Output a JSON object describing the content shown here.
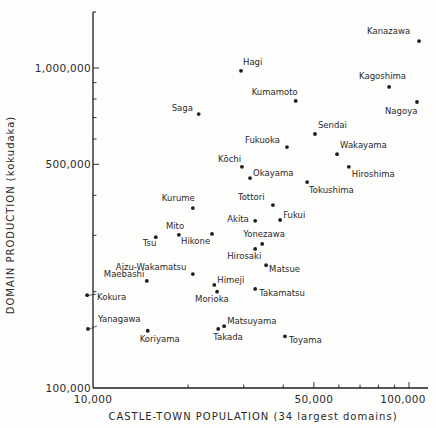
{
  "chart_data": {
    "type": "scatter",
    "title": "",
    "xlabel": "CASTLE-TOWN POPULATION (34 largest domains)",
    "ylabel": "DOMAIN PRODUCTION (kokudaka)",
    "xscale": "log",
    "yscale": "log",
    "xlim": [
      10000,
      110000
    ],
    "ylim": [
      100000,
      1300000
    ],
    "x_tick_labels": [
      "10,000",
      "50,000",
      "100,000"
    ],
    "y_tick_labels": [
      "100,000",
      "500,000",
      "1,000,000"
    ],
    "grid": false,
    "legend": null,
    "points": [
      {
        "name": "Kanazawa",
        "x": 107600,
        "y": 1214000
      },
      {
        "name": "Hagi",
        "x": 29400,
        "y": 980000
      },
      {
        "name": "Kagoshima",
        "x": 86500,
        "y": 873000
      },
      {
        "name": "Kumamoto",
        "x": 43800,
        "y": 789000
      },
      {
        "name": "Nagoya",
        "x": 106000,
        "y": 783000
      },
      {
        "name": "Saga",
        "x": 21600,
        "y": 718000
      },
      {
        "name": "Sendai",
        "x": 50400,
        "y": 622000
      },
      {
        "name": "Fukuoka",
        "x": 41100,
        "y": 566000
      },
      {
        "name": "Wakayama",
        "x": 59200,
        "y": 538000
      },
      {
        "name": "Kōchi",
        "x": 29600,
        "y": 491000
      },
      {
        "name": "Hiroshima",
        "x": 64500,
        "y": 491000
      },
      {
        "name": "Okayama",
        "x": 31400,
        "y": 453000
      },
      {
        "name": "Tokushima",
        "x": 47600,
        "y": 440000
      },
      {
        "name": "Tottori",
        "x": 37100,
        "y": 373000
      },
      {
        "name": "Kurume",
        "x": 20700,
        "y": 365000
      },
      {
        "name": "Fukui",
        "x": 39100,
        "y": 335000
      },
      {
        "name": "Akita",
        "x": 32600,
        "y": 333000
      },
      {
        "name": "Hikone",
        "x": 23800,
        "y": 303000
      },
      {
        "name": "Mito",
        "x": 18700,
        "y": 301000
      },
      {
        "name": "Tsu",
        "x": 15800,
        "y": 296000
      },
      {
        "name": "Yonezawa",
        "x": 34300,
        "y": 282000
      },
      {
        "name": "Hirosaki",
        "x": 32600,
        "y": 272000
      },
      {
        "name": "Matsue",
        "x": 35300,
        "y": 242000
      },
      {
        "name": "Aizu-Wakamatsu",
        "x": 20700,
        "y": 227000
      },
      {
        "name": "Maebashi",
        "x": 14800,
        "y": 216000
      },
      {
        "name": "Himeji",
        "x": 24200,
        "y": 210000
      },
      {
        "name": "Takamatsu",
        "x": 32600,
        "y": 204000
      },
      {
        "name": "Morioka",
        "x": 24700,
        "y": 200000
      },
      {
        "name": "Kokura",
        "x": 9580,
        "y": 195000
      },
      {
        "name": "Matsuyama",
        "x": 26000,
        "y": 156000
      },
      {
        "name": "Yanagawa",
        "x": 9640,
        "y": 153000
      },
      {
        "name": "Takada",
        "x": 24900,
        "y": 153000
      },
      {
        "name": "Koriyama",
        "x": 14900,
        "y": 151000
      },
      {
        "name": "Toyama",
        "x": 40500,
        "y": 145000
      }
    ]
  },
  "layout": {
    "plot": {
      "x0": 93,
      "x_decade_px": 316,
      "y0": 388,
      "y_decade_px": 320,
      "top": 12,
      "right": 428
    },
    "label_offsets": {
      "Kanazawa": [
        -52,
        -7,
        "start"
      ],
      "Hagi": [
        2,
        -6,
        "start"
      ],
      "Kagoshima": [
        -30,
        -8,
        "start"
      ],
      "Kumamoto": [
        -44,
        -6,
        "start"
      ],
      "Nagoya": [
        -32,
        12,
        "start"
      ],
      "Saga": [
        -27,
        -3,
        "start"
      ],
      "Sendai": [
        3,
        -6,
        "start"
      ],
      "Fukuoka": [
        -42,
        -4,
        "start"
      ],
      "Wakayama": [
        3,
        -6,
        "start"
      ],
      "Kōchi": [
        -24,
        -5,
        "start"
      ],
      "Hiroshima": [
        3,
        10,
        "start"
      ],
      "Okayama": [
        3,
        -2,
        "start"
      ],
      "Tokushima": [
        2,
        11,
        "start"
      ],
      "Tottori": [
        -35,
        -5,
        "start"
      ],
      "Kurume": [
        -31,
        -7,
        "start"
      ],
      "Fukui": [
        3,
        -2,
        "start"
      ],
      "Akita": [
        -28,
        1,
        "start"
      ],
      "Hikone": [
        -31,
        10,
        "start"
      ],
      "Mito": [
        -13,
        -6,
        "start"
      ],
      "Tsu": [
        -13,
        9,
        "start"
      ],
      "Yonezawa": [
        -19,
        -7,
        "start"
      ],
      "Hirosaki": [
        -28,
        10,
        "start"
      ],
      "Matsue": [
        3,
        7,
        "start"
      ],
      "Aizu-Wakamatsu": [
        -77,
        -4,
        "start"
      ],
      "Maebashi": [
        -43,
        -4,
        "start"
      ],
      "Himeji": [
        3,
        -2,
        "start"
      ],
      "Takamatsu": [
        4,
        7,
        "start"
      ],
      "Morioka": [
        -22,
        10,
        "start"
      ],
      "Kokura": [
        10,
        5,
        "start"
      ],
      "Matsuyama": [
        3,
        -2,
        "start"
      ],
      "Yanagawa": [
        10,
        -7,
        "start"
      ],
      "Takada": [
        -5,
        11,
        "start"
      ],
      "Koriyama": [
        -8,
        11,
        "start"
      ],
      "Toyama": [
        4,
        7,
        "start"
      ]
    },
    "leader_lines": [
      "Kokura",
      "Yanagawa"
    ],
    "x_ticks": [
      10000,
      20000,
      30000,
      40000,
      50000,
      60000,
      70000,
      80000,
      90000,
      100000
    ],
    "x_major": [
      50000,
      100000
    ],
    "y_ticks": [
      100000,
      200000,
      300000,
      400000,
      500000,
      600000,
      700000,
      800000,
      900000,
      1000000
    ],
    "y_major": [
      500000,
      1000000
    ]
  },
  "colors": {
    "ink": "#1e1e1e",
    "background": "#fdfdfb"
  }
}
